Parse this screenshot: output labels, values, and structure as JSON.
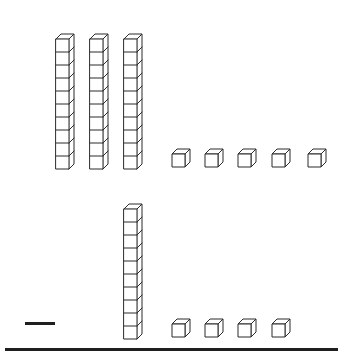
{
  "worksheet": {
    "title": "Base ten blocks subtraction problem",
    "operator_label": "minus",
    "answer_line_label": "answer line",
    "stroke_color": "#2b2b2b",
    "fill_color": "#ffffff",
    "background_color": "#ffffff",
    "rule_color": "#1f1f1f"
  },
  "problem": {
    "operation": "subtraction",
    "minuend": 35,
    "subtrahend": 14,
    "minuend_label": "35",
    "subtrahend_label": "14",
    "operator_symbol": "−"
  },
  "rows": [
    {
      "name": "minuend-row",
      "aria_label": "3 tens rods and 5 unit cubes",
      "tens_count": 3,
      "ones_count": 5,
      "value": 35,
      "tens": [
        {
          "name": "tens-rod",
          "x": 55,
          "y": 33,
          "units": 10
        },
        {
          "name": "tens-rod",
          "x": 89,
          "y": 33,
          "units": 10
        },
        {
          "name": "tens-rod",
          "x": 123,
          "y": 33,
          "units": 10
        }
      ],
      "ones": [
        {
          "name": "unit-cube",
          "x": 172,
          "y": 149
        },
        {
          "name": "unit-cube",
          "x": 205,
          "y": 149
        },
        {
          "name": "unit-cube",
          "x": 238,
          "y": 149
        },
        {
          "name": "unit-cube",
          "x": 272,
          "y": 149
        },
        {
          "name": "unit-cube",
          "x": 308,
          "y": 149
        }
      ]
    },
    {
      "name": "subtrahend-row",
      "aria_label": "1 tens rod and 4 unit cubes",
      "tens_count": 1,
      "ones_count": 4,
      "value": 14,
      "tens": [
        {
          "name": "tens-rod",
          "x": 123,
          "y": 203,
          "units": 10
        }
      ],
      "ones": [
        {
          "name": "unit-cube",
          "x": 172,
          "y": 319
        },
        {
          "name": "unit-cube",
          "x": 205,
          "y": 319
        },
        {
          "name": "unit-cube",
          "x": 238,
          "y": 319
        },
        {
          "name": "unit-cube",
          "x": 272,
          "y": 319
        }
      ]
    }
  ],
  "operator": {
    "name": "minus-sign",
    "symbol": "−",
    "x": 25,
    "y": 322,
    "width": 30,
    "height": 3
  },
  "answer_rule": {
    "name": "answer-line",
    "x": 5,
    "y": 348,
    "width": 333,
    "height": 3
  }
}
